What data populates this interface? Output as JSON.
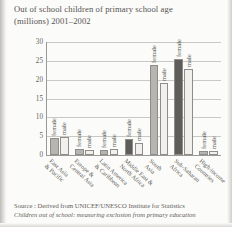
{
  "page": {
    "title_line1": "Out of school children of primary school age",
    "title_line2": "(millions) 2001–2002",
    "source_line1": "Source : Derived from UNICEF/UNESCO Institute for Statistics",
    "source_line2": "Children out of school: measuring exclusion from primary education"
  },
  "colors": {
    "female_bar": "#b6b5b0",
    "female_bar_dark": "#5e5d5a",
    "male_bar": "#f1f0ec",
    "axis": "#9a9995",
    "grid": "#c9c8c4",
    "text": "#55534f",
    "page_background": "#fbfbfa"
  },
  "chart_data": {
    "type": "bar",
    "title": "Out of school children of primary school age (millions) 2001–2002",
    "xlabel": "",
    "ylabel": "",
    "ylim": [
      0,
      30
    ],
    "yticks": [
      0,
      5,
      10,
      15,
      20,
      25,
      30
    ],
    "ytick_labels": [
      "0",
      "5",
      "10",
      "15",
      "20",
      "25",
      "30"
    ],
    "grid": true,
    "legend": "none",
    "bar_value_labels": [
      "female",
      "male"
    ],
    "categories": [
      "East Asia & Pacific",
      "Europe & Central Asia",
      "Latin America & Caribbean",
      "Middle East & North Africa",
      "South Asia",
      "Sub-Saharan Africa",
      "High-income Countries"
    ],
    "series": [
      {
        "name": "female",
        "values": [
          4.6,
          1.6,
          1.4,
          4.3,
          23.8,
          25.4,
          1.0
        ]
      },
      {
        "name": "male",
        "values": [
          4.8,
          1.3,
          1.7,
          3.2,
          19.0,
          22.9,
          1.1
        ]
      }
    ]
  }
}
